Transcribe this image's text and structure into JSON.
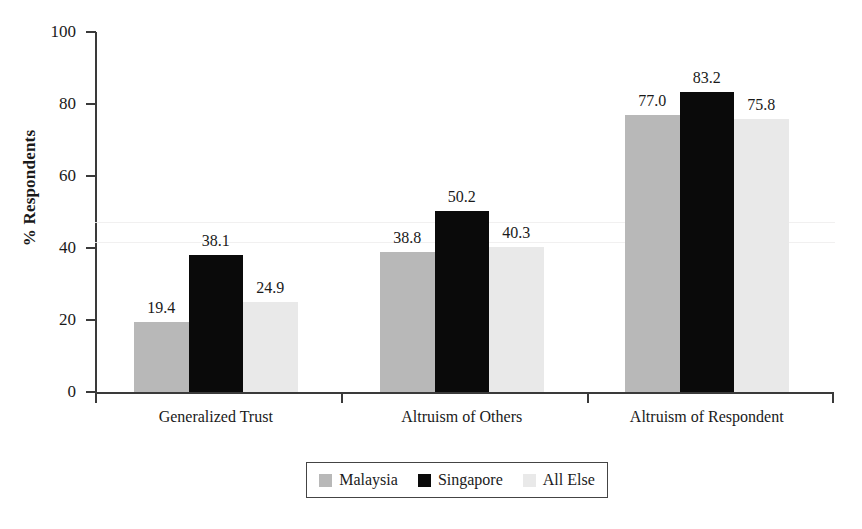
{
  "chart_data": {
    "type": "bar",
    "title": "",
    "xlabel": "",
    "ylabel": "% Respondents",
    "ylim": [
      0,
      100
    ],
    "yticks": [
      0,
      20,
      40,
      60,
      80,
      100
    ],
    "ytick_labels": [
      "0",
      "20",
      "40",
      "60",
      "80",
      "100"
    ],
    "grid": false,
    "legend_position": "bottom-center",
    "categories": [
      "Generalized Trust",
      "Altruism of Others",
      "Altruism of Respondent"
    ],
    "series": [
      {
        "name": "Malaysia",
        "color": "#b8b8b8",
        "values": [
          19.4,
          38.8,
          77.0
        ],
        "value_labels": [
          "19.4",
          "38.8",
          "77.0"
        ]
      },
      {
        "name": "Singapore",
        "color": "#0a0a0a",
        "values": [
          38.1,
          50.2,
          83.2
        ],
        "value_labels": [
          "38.1",
          "50.2",
          "83.2"
        ]
      },
      {
        "name": "All Else",
        "color": "#e9e9e9",
        "values": [
          24.9,
          40.3,
          75.8
        ],
        "value_labels": [
          "24.9",
          "40.3",
          "75.8"
        ]
      }
    ]
  },
  "legend": {
    "items": [
      {
        "label": "Malaysia"
      },
      {
        "label": "Singapore"
      },
      {
        "label": "All Else"
      }
    ]
  },
  "axes": {
    "y_title": "% Respondents"
  }
}
